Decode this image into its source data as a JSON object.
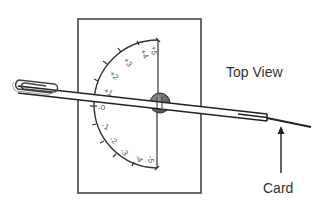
{
  "diagram": {
    "title": "Top View",
    "pointer_label": "Card",
    "scale_upper": [
      "+1",
      "+2",
      "+3",
      "+4",
      "+5"
    ],
    "scale_zero": "-0",
    "scale_lower": [
      "-1",
      "-2",
      "-3",
      "-4",
      "-5"
    ],
    "components": [
      "card-frame",
      "protractor-scale",
      "pivot-pin",
      "straw",
      "paperclip",
      "card-arrow"
    ],
    "colors": {
      "stroke": "#333333",
      "pivot": "#666666",
      "background": "#ffffff"
    }
  }
}
